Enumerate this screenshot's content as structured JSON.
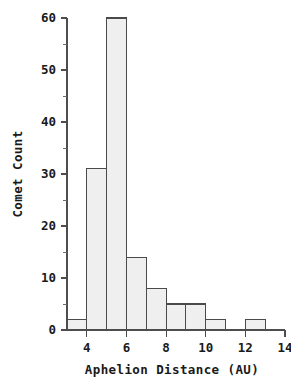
{
  "chart_data": {
    "type": "bar",
    "title": "",
    "subtitle": "",
    "xlabel": "Aphelion Distance (AU)",
    "ylabel": "Comet Count",
    "xlim": [
      3,
      14
    ],
    "ylim": [
      0,
      60
    ],
    "grid": false,
    "legend": null,
    "bin_width": 1,
    "categories": [
      "3-4",
      "4-5",
      "5-6",
      "6-7",
      "7-8",
      "8-9",
      "9-10",
      "10-11",
      "11-12",
      "12-13",
      "13-14"
    ],
    "bin_edges": [
      3,
      4,
      5,
      6,
      7,
      8,
      9,
      10,
      11,
      12,
      13,
      14
    ],
    "values": [
      2,
      31,
      60,
      14,
      8,
      5,
      5,
      2,
      0,
      2,
      0
    ],
    "x_ticks_major": [
      4,
      6,
      8,
      10,
      12,
      14
    ],
    "x_tick_labels": [
      "4",
      "6",
      "8",
      "10",
      "12",
      "14"
    ],
    "x_ticks_minor": [
      3,
      5,
      7,
      9,
      11,
      13
    ],
    "y_ticks_major": [
      0,
      10,
      20,
      30,
      40,
      50,
      60
    ],
    "y_tick_labels": [
      "0",
      "10",
      "20",
      "30",
      "40",
      "50",
      "60"
    ],
    "y_ticks_minor": [
      5,
      15,
      25,
      35,
      45,
      55
    ],
    "colors": {
      "bar_fill": "#efefef",
      "bar_stroke": "#4a4a4a",
      "axis": "#4d4d4d",
      "text": "#1a1a1a",
      "background": "#ffffff"
    }
  }
}
